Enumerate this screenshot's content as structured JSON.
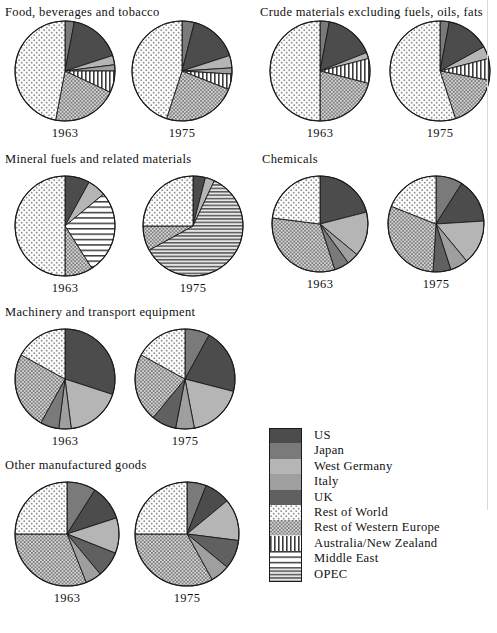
{
  "figure": {
    "type": "pie-grid",
    "years": [
      "1963",
      "1975"
    ],
    "colors": {
      "US": "#4c4c4c",
      "Japan": "#7a7a7a",
      "West Germany": "#b5b5b5",
      "Italy": "#9f9f9f",
      "UK": "#606060",
      "Rest of World": "#fbfbfb",
      "Rest of Western Europe": "#cfcfcf",
      "Australia/New Zealand": "#ffffff",
      "Middle East": "#ffffff",
      "OPEC": "#e2e2e2"
    }
  },
  "legend": {
    "title": "",
    "items": [
      {
        "label": "US",
        "pattern": "solid-dark",
        "swatch_class": "sw-us"
      },
      {
        "label": "Japan",
        "pattern": "solid-medium-dark",
        "swatch_class": "sw-japan"
      },
      {
        "label": "West Germany",
        "pattern": "solid-light",
        "swatch_class": "sw-wg"
      },
      {
        "label": "Italy",
        "pattern": "solid-medium-light",
        "swatch_class": "sw-italy"
      },
      {
        "label": "UK",
        "pattern": "solid-dark-gray",
        "swatch_class": "sw-uk"
      },
      {
        "label": "Rest of World",
        "pattern": "fine-dots-light",
        "swatch_class": "sw-row"
      },
      {
        "label": "Rest of Western Europe",
        "pattern": "dots-dense",
        "swatch_class": "sw-rwe"
      },
      {
        "label": "Australia/New Zealand",
        "pattern": "vertical-stripes",
        "swatch_class": "sw-anz"
      },
      {
        "label": "Middle East",
        "pattern": "horizontal-stripes-wide",
        "swatch_class": "sw-me"
      },
      {
        "label": "OPEC",
        "pattern": "horizontal-stripes-dense",
        "swatch_class": "sw-opec"
      }
    ]
  },
  "chart_data": {
    "type": "pie",
    "title": "",
    "legend_position": "bottom-right",
    "categories": [
      "US",
      "Japan",
      "West Germany",
      "Italy",
      "UK",
      "Rest of World",
      "Rest of Western Europe",
      "Australia/New Zealand",
      "Middle East",
      "OPEC"
    ],
    "panels": [
      {
        "title": "Food, beverages and tobacco",
        "charts": [
          {
            "year": "1963",
            "slices": [
              {
                "label": "Japan",
                "value": 3
              },
              {
                "label": "US",
                "value": 17
              },
              {
                "label": "West Germany",
                "value": 3
              },
              {
                "label": "Italy",
                "value": 2
              },
              {
                "label": "Australia/New Zealand",
                "value": 7
              },
              {
                "label": "Rest of Western Europe",
                "value": 21
              },
              {
                "label": "Rest of World",
                "value": 47
              }
            ]
          },
          {
            "year": "1975",
            "slices": [
              {
                "label": "Japan",
                "value": 4
              },
              {
                "label": "US",
                "value": 16
              },
              {
                "label": "West Germany",
                "value": 4
              },
              {
                "label": "Italy",
                "value": 2
              },
              {
                "label": "Australia/New Zealand",
                "value": 5
              },
              {
                "label": "Rest of Western Europe",
                "value": 24
              },
              {
                "label": "Rest of World",
                "value": 45
              }
            ]
          }
        ]
      },
      {
        "title": "Crude materials excluding fuels, oils, fats",
        "charts": [
          {
            "year": "1963",
            "slices": [
              {
                "label": "Japan",
                "value": 3
              },
              {
                "label": "US",
                "value": 16
              },
              {
                "label": "West Germany",
                "value": 2
              },
              {
                "label": "Australia/New Zealand",
                "value": 8
              },
              {
                "label": "Rest of Western Europe",
                "value": 21
              },
              {
                "label": "Rest of World",
                "value": 50
              }
            ]
          },
          {
            "year": "1975",
            "slices": [
              {
                "label": "Japan",
                "value": 3
              },
              {
                "label": "US",
                "value": 14
              },
              {
                "label": "West Germany",
                "value": 4
              },
              {
                "label": "Australia/New Zealand",
                "value": 7
              },
              {
                "label": "Rest of Western Europe",
                "value": 17
              },
              {
                "label": "Rest of World",
                "value": 55
              }
            ]
          }
        ]
      },
      {
        "title": "Mineral fuels and related materials",
        "charts": [
          {
            "year": "1963",
            "slices": [
              {
                "label": "US",
                "value": 8
              },
              {
                "label": "West Germany",
                "value": 6
              },
              {
                "label": "Middle East",
                "value": 27
              },
              {
                "label": "Rest of Western Europe",
                "value": 9
              },
              {
                "label": "Rest of World",
                "value": 50
              }
            ]
          },
          {
            "year": "1975",
            "slices": [
              {
                "label": "US",
                "value": 4
              },
              {
                "label": "West Germany",
                "value": 3
              },
              {
                "label": "OPEC",
                "value": 60
              },
              {
                "label": "Rest of Western Europe",
                "value": 8
              },
              {
                "label": "Rest of World",
                "value": 25
              }
            ]
          }
        ]
      },
      {
        "title": "Chemicals",
        "charts": [
          {
            "year": "1963",
            "slices": [
              {
                "label": "US",
                "value": 21
              },
              {
                "label": "West Germany",
                "value": 15
              },
              {
                "label": "Italy",
                "value": 4
              },
              {
                "label": "Japan",
                "value": 5
              },
              {
                "label": "Rest of Western Europe",
                "value": 32
              },
              {
                "label": "Rest of World",
                "value": 23
              }
            ]
          },
          {
            "year": "1975",
            "slices": [
              {
                "label": "Japan",
                "value": 9
              },
              {
                "label": "US",
                "value": 15
              },
              {
                "label": "West Germany",
                "value": 15
              },
              {
                "label": "Italy",
                "value": 6
              },
              {
                "label": "UK",
                "value": 6
              },
              {
                "label": "Rest of Western Europe",
                "value": 30
              },
              {
                "label": "Rest of World",
                "value": 19
              }
            ]
          }
        ]
      },
      {
        "title": "Machinery and transport equipment",
        "charts": [
          {
            "year": "1963",
            "slices": [
              {
                "label": "US",
                "value": 30
              },
              {
                "label": "West Germany",
                "value": 18
              },
              {
                "label": "Italy",
                "value": 4
              },
              {
                "label": "Japan",
                "value": 6
              },
              {
                "label": "Rest of Western Europe",
                "value": 25
              },
              {
                "label": "Rest of World",
                "value": 17
              }
            ]
          },
          {
            "year": "1975",
            "slices": [
              {
                "label": "Japan",
                "value": 8
              },
              {
                "label": "US",
                "value": 21
              },
              {
                "label": "West Germany",
                "value": 18
              },
              {
                "label": "Italy",
                "value": 6
              },
              {
                "label": "UK",
                "value": 8
              },
              {
                "label": "Rest of Western Europe",
                "value": 22
              },
              {
                "label": "Rest of World",
                "value": 17
              }
            ]
          }
        ]
      },
      {
        "title": "Other manufactured goods",
        "charts": [
          {
            "year": "1963",
            "slices": [
              {
                "label": "Japan",
                "value": 9
              },
              {
                "label": "US",
                "value": 11
              },
              {
                "label": "West Germany",
                "value": 11
              },
              {
                "label": "UK",
                "value": 8
              },
              {
                "label": "Italy",
                "value": 5
              },
              {
                "label": "Rest of Western Europe",
                "value": 31
              },
              {
                "label": "Rest of World",
                "value": 25
              }
            ]
          },
          {
            "year": "1975",
            "slices": [
              {
                "label": "Japan",
                "value": 6
              },
              {
                "label": "US",
                "value": 8
              },
              {
                "label": "West Germany",
                "value": 13
              },
              {
                "label": "UK",
                "value": 9
              },
              {
                "label": "Italy",
                "value": 6
              },
              {
                "label": "Rest of Western Europe",
                "value": 33
              },
              {
                "label": "Rest of World",
                "value": 25
              }
            ]
          }
        ]
      }
    ]
  },
  "panel_layout": [
    {
      "left": 5,
      "title_top": 5,
      "pies_top": 17,
      "radius": 50,
      "gap": 117
    },
    {
      "left": 260,
      "title_top": 5,
      "pies_top": 17,
      "radius": 50,
      "gap": 120
    },
    {
      "left": 5,
      "title_top": 152,
      "pies_top": 172,
      "radius": 50,
      "gap": 128
    },
    {
      "left": 262,
      "title_top": 152,
      "pies_top": 172,
      "radius": 48,
      "gap": 116
    },
    {
      "left": 5,
      "title_top": 305,
      "pies_top": 325,
      "radius": 50,
      "gap": 120
    },
    {
      "left": 5,
      "title_top": 458,
      "pies_top": 478,
      "radius": 52,
      "gap": 120
    }
  ]
}
